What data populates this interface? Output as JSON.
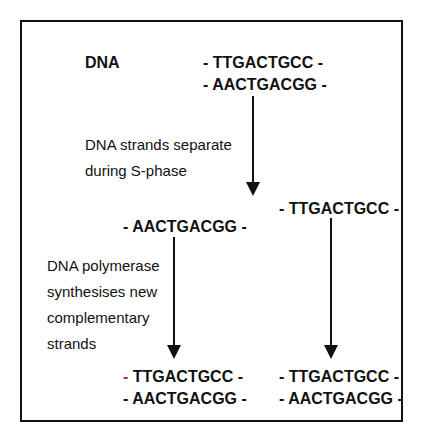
{
  "diagram": {
    "dna_label": "DNA",
    "original": {
      "top": "- TTGACTGCC -",
      "bottom": "- AACTGACGG -"
    },
    "step1_caption": [
      "DNA strands separate",
      "during S-phase"
    ],
    "separated": {
      "left": "- AACTGACGG -",
      "right": "- TTGACTGCC -"
    },
    "step2_caption": [
      "DNA polymerase",
      "synthesises new",
      "complementary",
      "strands"
    ],
    "result_left": {
      "dash": "-",
      "top_rest": " TTGACTGCC -",
      "bottom": "- AACTGACGG -"
    },
    "result_right": {
      "top": "- TTGACTGCC -",
      "bottom": "- AACTGACGG -"
    },
    "colors": {
      "line": "#111111",
      "new_strand_accent": "#b0306a"
    }
  }
}
